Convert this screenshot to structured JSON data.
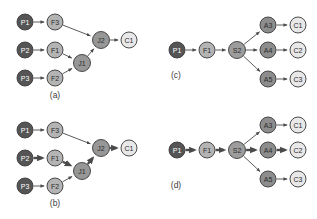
{
  "figure": {
    "width": 317,
    "height": 219,
    "background": "#ffffff"
  },
  "palette": {
    "producer_fill": "#555555",
    "producer_text": "#ffffff",
    "filter_fill": "#b4b4b4",
    "filter_text": "#2b2b2b",
    "join_fill": "#979797",
    "join_text": "#2b2b2b",
    "split_fill": "#9d9d9d",
    "split_text": "#2b2b2b",
    "action_fill": "#8d8d8d",
    "action_text": "#2b2b2b",
    "consumer_fill": "#e8e8e8",
    "consumer_text": "#2b2b2b",
    "edge_color": "#4a4a4a",
    "node_stroke": "#3a3a3a"
  },
  "edge_widths": {
    "normal": 0.9,
    "highlighted": 2.4
  },
  "panels": [
    {
      "id": "a",
      "caption": "(a)",
      "caption_x": 55,
      "caption_y": 95,
      "nodes": [
        {
          "id": "a-P1",
          "label": "P1",
          "x": 25,
          "y": 22,
          "r": 8.0,
          "role": "producer"
        },
        {
          "id": "a-F3",
          "label": "F3",
          "x": 55,
          "y": 22,
          "r": 8.0,
          "role": "filter"
        },
        {
          "id": "a-P2",
          "label": "P2",
          "x": 25,
          "y": 50,
          "r": 8.0,
          "role": "producer"
        },
        {
          "id": "a-F1",
          "label": "F1",
          "x": 55,
          "y": 50,
          "r": 8.0,
          "role": "filter"
        },
        {
          "id": "a-P3",
          "label": "P3",
          "x": 25,
          "y": 78,
          "r": 8.0,
          "role": "producer"
        },
        {
          "id": "a-F2",
          "label": "F2",
          "x": 55,
          "y": 78,
          "r": 8.0,
          "role": "filter"
        },
        {
          "id": "a-J1",
          "label": "J1",
          "x": 82,
          "y": 63,
          "r": 8.5,
          "role": "join"
        },
        {
          "id": "a-J2",
          "label": "J2",
          "x": 101,
          "y": 40,
          "r": 8.5,
          "role": "join"
        },
        {
          "id": "a-C1",
          "label": "C1",
          "x": 129,
          "y": 40,
          "r": 8.0,
          "role": "consumer"
        }
      ],
      "edges": [
        {
          "from": "a-P1",
          "to": "a-F3",
          "highlighted": false
        },
        {
          "from": "a-P2",
          "to": "a-F1",
          "highlighted": false
        },
        {
          "from": "a-P3",
          "to": "a-F2",
          "highlighted": false
        },
        {
          "from": "a-F3",
          "to": "a-J2",
          "highlighted": false
        },
        {
          "from": "a-F1",
          "to": "a-J1",
          "highlighted": false
        },
        {
          "from": "a-F2",
          "to": "a-J1",
          "highlighted": false
        },
        {
          "from": "a-J1",
          "to": "a-J2",
          "highlighted": false
        },
        {
          "from": "a-J2",
          "to": "a-C1",
          "highlighted": false
        }
      ]
    },
    {
      "id": "b",
      "caption": "(b)",
      "caption_x": 55,
      "caption_y": 203,
      "nodes": [
        {
          "id": "b-P1",
          "label": "P1",
          "x": 25,
          "y": 130,
          "r": 8.0,
          "role": "producer"
        },
        {
          "id": "b-F3",
          "label": "F3",
          "x": 55,
          "y": 130,
          "r": 8.0,
          "role": "filter"
        },
        {
          "id": "b-P2",
          "label": "P2",
          "x": 25,
          "y": 158,
          "r": 8.0,
          "role": "producer"
        },
        {
          "id": "b-F1",
          "label": "F1",
          "x": 55,
          "y": 158,
          "r": 8.0,
          "role": "filter"
        },
        {
          "id": "b-P3",
          "label": "P3",
          "x": 25,
          "y": 186,
          "r": 8.0,
          "role": "producer"
        },
        {
          "id": "b-F2",
          "label": "F2",
          "x": 55,
          "y": 186,
          "r": 8.0,
          "role": "filter"
        },
        {
          "id": "b-J1",
          "label": "J1",
          "x": 82,
          "y": 171,
          "r": 8.5,
          "role": "join"
        },
        {
          "id": "b-J2",
          "label": "J2",
          "x": 101,
          "y": 148,
          "r": 8.5,
          "role": "join"
        },
        {
          "id": "b-C1",
          "label": "C1",
          "x": 129,
          "y": 148,
          "r": 8.0,
          "role": "consumer"
        }
      ],
      "edges": [
        {
          "from": "b-P1",
          "to": "b-F3",
          "highlighted": false
        },
        {
          "from": "b-P2",
          "to": "b-F1",
          "highlighted": true
        },
        {
          "from": "b-P3",
          "to": "b-F2",
          "highlighted": false
        },
        {
          "from": "b-F3",
          "to": "b-J2",
          "highlighted": false
        },
        {
          "from": "b-F1",
          "to": "b-J1",
          "highlighted": true
        },
        {
          "from": "b-F2",
          "to": "b-J1",
          "highlighted": false
        },
        {
          "from": "b-J1",
          "to": "b-J2",
          "highlighted": true
        },
        {
          "from": "b-J2",
          "to": "b-C1",
          "highlighted": true
        }
      ]
    },
    {
      "id": "c",
      "caption": "(c)",
      "caption_x": 176,
      "caption_y": 75,
      "nodes": [
        {
          "id": "c-P1",
          "label": "P1",
          "x": 177,
          "y": 50,
          "r": 8.0,
          "role": "producer"
        },
        {
          "id": "c-F1",
          "label": "F1",
          "x": 207,
          "y": 50,
          "r": 8.0,
          "role": "filter"
        },
        {
          "id": "c-S2",
          "label": "S2",
          "x": 237,
          "y": 50,
          "r": 8.5,
          "role": "split"
        },
        {
          "id": "c-A3",
          "label": "A3",
          "x": 268,
          "y": 25,
          "r": 8.0,
          "role": "action"
        },
        {
          "id": "c-A4",
          "label": "A4",
          "x": 268,
          "y": 50,
          "r": 8.0,
          "role": "action"
        },
        {
          "id": "c-A5",
          "label": "A5",
          "x": 268,
          "y": 79,
          "r": 8.0,
          "role": "action"
        },
        {
          "id": "c-C1",
          "label": "C1",
          "x": 298,
          "y": 25,
          "r": 8.0,
          "role": "consumer"
        },
        {
          "id": "c-C2",
          "label": "C2",
          "x": 298,
          "y": 50,
          "r": 8.0,
          "role": "consumer"
        },
        {
          "id": "c-C3",
          "label": "C3",
          "x": 298,
          "y": 79,
          "r": 8.0,
          "role": "consumer"
        }
      ],
      "edges": [
        {
          "from": "c-P1",
          "to": "c-F1",
          "highlighted": false
        },
        {
          "from": "c-F1",
          "to": "c-S2",
          "highlighted": false
        },
        {
          "from": "c-S2",
          "to": "c-A3",
          "highlighted": false
        },
        {
          "from": "c-S2",
          "to": "c-A4",
          "highlighted": false
        },
        {
          "from": "c-S2",
          "to": "c-A5",
          "highlighted": false
        },
        {
          "from": "c-A3",
          "to": "c-C1",
          "highlighted": false
        },
        {
          "from": "c-A4",
          "to": "c-C2",
          "highlighted": false
        },
        {
          "from": "c-A5",
          "to": "c-C3",
          "highlighted": false
        }
      ]
    },
    {
      "id": "d",
      "caption": "(d)",
      "caption_x": 176,
      "caption_y": 185,
      "nodes": [
        {
          "id": "d-P1",
          "label": "P1",
          "x": 177,
          "y": 150,
          "r": 8.0,
          "role": "producer"
        },
        {
          "id": "d-F1",
          "label": "F1",
          "x": 207,
          "y": 150,
          "r": 8.0,
          "role": "filter"
        },
        {
          "id": "d-S2",
          "label": "S2",
          "x": 237,
          "y": 150,
          "r": 8.5,
          "role": "split"
        },
        {
          "id": "d-A3",
          "label": "A3",
          "x": 268,
          "y": 125,
          "r": 8.0,
          "role": "action"
        },
        {
          "id": "d-A4",
          "label": "A4",
          "x": 268,
          "y": 150,
          "r": 8.0,
          "role": "action"
        },
        {
          "id": "d-A5",
          "label": "A5",
          "x": 268,
          "y": 179,
          "r": 8.0,
          "role": "action"
        },
        {
          "id": "d-C1",
          "label": "C1",
          "x": 298,
          "y": 125,
          "r": 8.0,
          "role": "consumer"
        },
        {
          "id": "d-C2",
          "label": "C2",
          "x": 298,
          "y": 150,
          "r": 8.0,
          "role": "consumer"
        },
        {
          "id": "d-C3",
          "label": "C3",
          "x": 298,
          "y": 179,
          "r": 8.0,
          "role": "consumer"
        }
      ],
      "edges": [
        {
          "from": "d-P1",
          "to": "d-F1",
          "highlighted": true
        },
        {
          "from": "d-F1",
          "to": "d-S2",
          "highlighted": true
        },
        {
          "from": "d-S2",
          "to": "d-A3",
          "highlighted": false
        },
        {
          "from": "d-S2",
          "to": "d-A4",
          "highlighted": true
        },
        {
          "from": "d-S2",
          "to": "d-A5",
          "highlighted": false
        },
        {
          "from": "d-A3",
          "to": "d-C1",
          "highlighted": false
        },
        {
          "from": "d-A4",
          "to": "d-C2",
          "highlighted": true
        },
        {
          "from": "d-A5",
          "to": "d-C3",
          "highlighted": false
        }
      ]
    }
  ]
}
